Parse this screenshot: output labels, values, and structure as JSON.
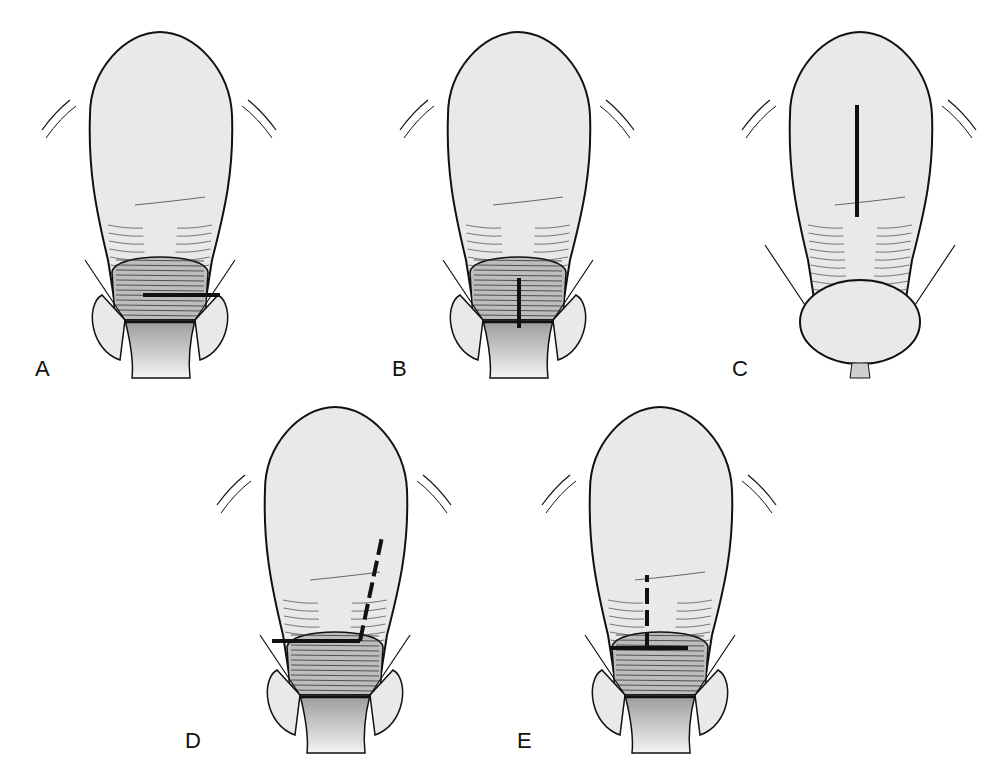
{
  "figure": {
    "colors": {
      "outline": "#111111",
      "fill": "#e9e9e9",
      "hatch": "#444444",
      "incision": "#111111",
      "cervix_fill": "#cfcfcf"
    }
  },
  "panels": [
    {
      "label": "A",
      "incision_type": "low transverse",
      "x": 30,
      "y": 20,
      "label_x": 35,
      "label_y": 358,
      "variant": "lus",
      "marks": [
        {
          "kind": "solid",
          "x1": 113,
          "y1": 275,
          "x2": 190,
          "y2": 275
        }
      ]
    },
    {
      "label": "B",
      "incision_type": "low vertical",
      "x": 388,
      "y": 20,
      "label_x": 392,
      "label_y": 358,
      "variant": "lus",
      "marks": [
        {
          "kind": "solid",
          "x1": 131,
          "y1": 258,
          "x2": 131,
          "y2": 308
        }
      ]
    },
    {
      "label": "C",
      "incision_type": "classical",
      "x": 730,
      "y": 20,
      "label_x": 732,
      "label_y": 358,
      "variant": "classical",
      "marks": [
        {
          "kind": "solid",
          "x1": 127,
          "y1": 85,
          "x2": 127,
          "y2": 197
        }
      ]
    },
    {
      "label": "D",
      "incision_type": "J-shaped",
      "x": 205,
      "y": 395,
      "label_x": 185,
      "label_y": 730,
      "variant": "lus",
      "marks": [
        {
          "kind": "solid",
          "x1": 67,
          "y1": 246,
          "x2": 155,
          "y2": 246
        },
        {
          "kind": "dashed",
          "x1": 155,
          "y1": 246,
          "x2": 177,
          "y2": 142
        }
      ]
    },
    {
      "label": "E",
      "incision_type": "inverted T",
      "x": 530,
      "y": 395,
      "label_x": 517,
      "label_y": 730,
      "variant": "lus",
      "marks": [
        {
          "kind": "solid",
          "x1": 80,
          "y1": 253,
          "x2": 158,
          "y2": 253
        },
        {
          "kind": "dashed",
          "x1": 117,
          "y1": 253,
          "x2": 117,
          "y2": 180
        }
      ]
    }
  ]
}
